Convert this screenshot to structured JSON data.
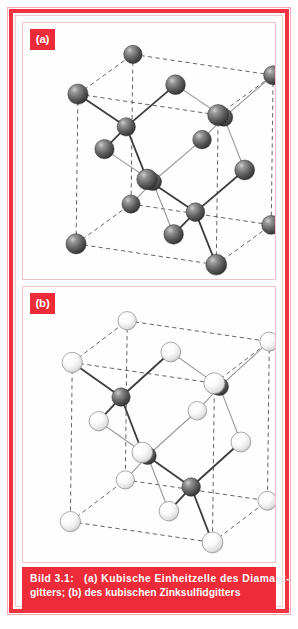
{
  "figure": {
    "panels": [
      {
        "label": "(a)",
        "name": "diamond-cubic-unit-cell",
        "description": "Kubische Einheitzelle des Diamantgitters",
        "atom_types": [
          "gray"
        ]
      },
      {
        "label": "(b)",
        "name": "zinc-blende-unit-cell",
        "description": "Kubische Einheitzelle des Zinksulfidgitters",
        "atom_types": [
          "white",
          "gray"
        ]
      }
    ],
    "caption": {
      "line1": "Bild 3.1:   (a) Kubische Einheitzelle des Diamant-",
      "line2": "gitters; (b) des kubischen Zinksulfidgitters",
      "figure_number": "Bild 3.1:"
    },
    "colors": {
      "frame_red": "#ef3340",
      "caption_red": "#ee2b38",
      "label_red": "#ee2b38",
      "atom_gray": "#555555",
      "atom_white": "#ffffff",
      "bond_gray": "#808080",
      "cell_edge": "#555555",
      "panel_border": "#f3c2c8",
      "background": "#ffffff"
    }
  },
  "chart_data": {
    "type": "scatter",
    "xlabel": "",
    "ylabel": "",
    "panels": [
      {
        "id": "a",
        "label": "(a)",
        "structure": "diamond cubic",
        "legend": [
          "Kohlenstoffatom (grau)"
        ],
        "corner_atoms": 8,
        "face_atoms": 6,
        "interior_atoms": 4,
        "atoms": [
          {
            "x": 0,
            "y": 0,
            "z": 0,
            "kind": "gray"
          },
          {
            "x": 1,
            "y": 0,
            "z": 0,
            "kind": "gray"
          },
          {
            "x": 0,
            "y": 1,
            "z": 0,
            "kind": "gray"
          },
          {
            "x": 1,
            "y": 1,
            "z": 0,
            "kind": "gray"
          },
          {
            "x": 0,
            "y": 0,
            "z": 1,
            "kind": "gray"
          },
          {
            "x": 1,
            "y": 0,
            "z": 1,
            "kind": "gray"
          },
          {
            "x": 0,
            "y": 1,
            "z": 1,
            "kind": "gray"
          },
          {
            "x": 1,
            "y": 1,
            "z": 1,
            "kind": "gray"
          },
          {
            "x": 0.5,
            "y": 0.5,
            "z": 0,
            "kind": "gray"
          },
          {
            "x": 0.5,
            "y": 0.5,
            "z": 1,
            "kind": "gray"
          },
          {
            "x": 0.5,
            "y": 0,
            "z": 0.5,
            "kind": "gray"
          },
          {
            "x": 0.5,
            "y": 1,
            "z": 0.5,
            "kind": "gray"
          },
          {
            "x": 0,
            "y": 0.5,
            "z": 0.5,
            "kind": "gray"
          },
          {
            "x": 1,
            "y": 0.5,
            "z": 0.5,
            "kind": "gray"
          },
          {
            "x": 0.25,
            "y": 0.25,
            "z": 0.25,
            "kind": "gray"
          },
          {
            "x": 0.75,
            "y": 0.75,
            "z": 0.25,
            "kind": "gray"
          },
          {
            "x": 0.75,
            "y": 0.25,
            "z": 0.75,
            "kind": "gray"
          },
          {
            "x": 0.25,
            "y": 0.75,
            "z": 0.75,
            "kind": "gray"
          }
        ]
      },
      {
        "id": "b",
        "label": "(b)",
        "structure": "zinc blende (sphalerite)",
        "legend": [
          "Zinkatom (dunkel)",
          "Schwefelatom (hell)"
        ],
        "corner_atoms": 8,
        "face_atoms": 6,
        "interior_atoms": 4,
        "atoms": [
          {
            "x": 0,
            "y": 0,
            "z": 0,
            "kind": "white"
          },
          {
            "x": 1,
            "y": 0,
            "z": 0,
            "kind": "white"
          },
          {
            "x": 0,
            "y": 1,
            "z": 0,
            "kind": "white"
          },
          {
            "x": 1,
            "y": 1,
            "z": 0,
            "kind": "white"
          },
          {
            "x": 0,
            "y": 0,
            "z": 1,
            "kind": "white"
          },
          {
            "x": 1,
            "y": 0,
            "z": 1,
            "kind": "white"
          },
          {
            "x": 0,
            "y": 1,
            "z": 1,
            "kind": "white"
          },
          {
            "x": 1,
            "y": 1,
            "z": 1,
            "kind": "white"
          },
          {
            "x": 0.5,
            "y": 0.5,
            "z": 0,
            "kind": "white"
          },
          {
            "x": 0.5,
            "y": 0.5,
            "z": 1,
            "kind": "white"
          },
          {
            "x": 0.5,
            "y": 0,
            "z": 0.5,
            "kind": "white"
          },
          {
            "x": 0.5,
            "y": 1,
            "z": 0.5,
            "kind": "white"
          },
          {
            "x": 0,
            "y": 0.5,
            "z": 0.5,
            "kind": "white"
          },
          {
            "x": 1,
            "y": 0.5,
            "z": 0.5,
            "kind": "white"
          },
          {
            "x": 0.25,
            "y": 0.25,
            "z": 0.25,
            "kind": "gray"
          },
          {
            "x": 0.75,
            "y": 0.75,
            "z": 0.25,
            "kind": "gray"
          },
          {
            "x": 0.75,
            "y": 0.25,
            "z": 0.75,
            "kind": "gray"
          },
          {
            "x": 0.25,
            "y": 0.75,
            "z": 0.75,
            "kind": "gray"
          }
        ]
      }
    ]
  }
}
